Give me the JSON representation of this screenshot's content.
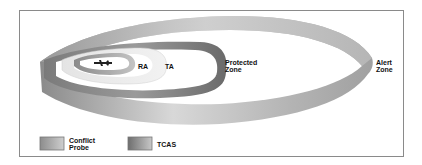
{
  "diagram": {
    "zones": [
      {
        "id": "ra",
        "label": "RA"
      },
      {
        "id": "ta",
        "label": "TA"
      },
      {
        "id": "protected",
        "label": "Protected\nZone"
      },
      {
        "id": "alert",
        "label": "Alert\nZone"
      }
    ],
    "legend": [
      {
        "label": "Conflict\nProbe",
        "gradient_from": "#8c8c8c",
        "gradient_to": "#cfcfcf"
      },
      {
        "label": "TCAS",
        "gradient_from": "#6e6e6e",
        "gradient_to": "#c8c8c8"
      }
    ],
    "colors": {
      "frame": "#8a8a8a",
      "band_dark": "#6f6f6f",
      "band_mid": "#a8a8a8",
      "band_light": "#dcdcdc"
    }
  }
}
